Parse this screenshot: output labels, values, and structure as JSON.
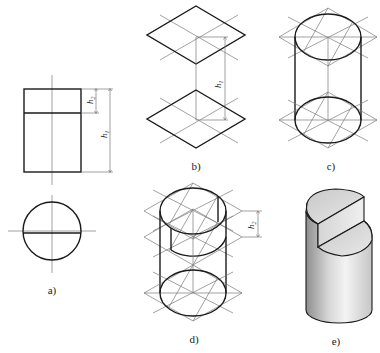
{
  "figure": {
    "type": "technical-drawing"
  },
  "panels": [
    {
      "id": "a",
      "label": "a)",
      "description": "Orthographic front and top views",
      "dimensions": [
        "h2",
        "h1"
      ]
    },
    {
      "id": "b",
      "label": "b)",
      "description": "Isometric rhombi for top and bottom faces",
      "dimensions": [
        "h1"
      ]
    },
    {
      "id": "c",
      "label": "c)",
      "description": "Four-center ellipses inscribed in rhombi, cylinder outline"
    },
    {
      "id": "d",
      "label": "d)",
      "description": "Ellipse offset by cut depth",
      "dimensions": [
        "h2"
      ]
    },
    {
      "id": "e",
      "label": "e)",
      "description": "Finished shaded solid"
    }
  ],
  "dimension_labels": {
    "h1_base": "h",
    "h1_sub": "1",
    "h2_base": "h",
    "h2_sub": "2"
  },
  "colors": {
    "line": "#1a1a1a",
    "construction": "#7a7a7a",
    "shade_light": "#f2f2f2",
    "shade_dark": "#9a9a9a"
  }
}
